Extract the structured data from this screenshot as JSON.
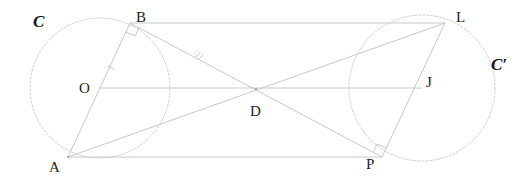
{
  "diagram": {
    "circles": [
      {
        "name": "C",
        "label": "C",
        "center": "O",
        "cx": 100,
        "cy": 88,
        "r": 70
      },
      {
        "name": "C'",
        "label": "C′",
        "center": "J",
        "cx": 422,
        "cy": 88,
        "r": 73
      }
    ],
    "points": {
      "A": {
        "label": "A",
        "x": 68,
        "y": 157
      },
      "B": {
        "label": "B",
        "x": 130,
        "y": 23
      },
      "O": {
        "label": "O",
        "x": 100,
        "y": 88
      },
      "D": {
        "label": "D",
        "x": 256,
        "y": 89
      },
      "J": {
        "label": "J",
        "x": 422,
        "y": 88
      },
      "L": {
        "label": "L",
        "x": 445,
        "y": 23
      },
      "P": {
        "label": "P",
        "x": 382,
        "y": 157
      }
    },
    "segments": [
      "A-B",
      "B-L",
      "A-P",
      "O-J",
      "A-L",
      "B-P",
      "L-P"
    ],
    "right_angles": [
      "B",
      "P"
    ],
    "tick_marks": [
      "O-B",
      "B-D"
    ],
    "colors": {
      "line": "#c8c8c8",
      "label": "#222222",
      "circle": "#cfcfcf"
    }
  }
}
